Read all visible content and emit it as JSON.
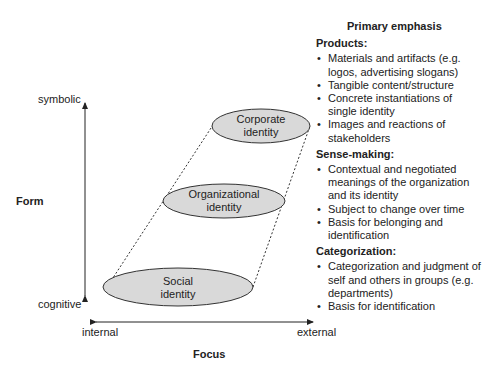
{
  "axes": {
    "vertical": {
      "title": "Form",
      "top_label": "symbolic",
      "bottom_label": "cognitive"
    },
    "horizontal": {
      "title": "Focus",
      "left_label": "internal",
      "right_label": "external"
    }
  },
  "ellipses": [
    {
      "line1": "Corporate",
      "line2": "identity"
    },
    {
      "line1": "Organizational",
      "line2": "identity"
    },
    {
      "line1": "Social",
      "line2": "identity"
    }
  ],
  "panel": {
    "title": "Primary emphasis",
    "sections": [
      {
        "title": "Products:",
        "items": [
          "Materials and artifacts (e.g. logos, advertising slogans)",
          "Tangible content/structure",
          "Concrete instantiations of single identity",
          "Images and reactions of stakeholders"
        ]
      },
      {
        "title": "Sense-making:",
        "items": [
          "Contextual and negotiated meanings of the organization and its identity",
          "Subject to change over time",
          "Basis for belonging and identification"
        ]
      },
      {
        "title": "Categorization:",
        "items": [
          "Categorization and judgment of self and others in groups (e.g. departments)",
          "Basis for identification"
        ]
      }
    ]
  },
  "colors": {
    "ellipse_fill": "#d9d9d9",
    "stroke": "#333333"
  }
}
